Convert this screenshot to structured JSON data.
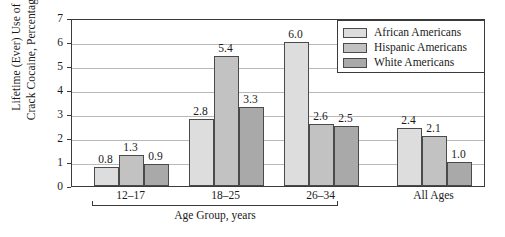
{
  "chart_data": {
    "type": "bar",
    "title": "",
    "xlabel": "Age Group, years",
    "ylabel": "Lifetime (Ever) Use of Crack Cocaine, Percentage",
    "ylabel_line1": "Lifetime (Ever) Use of",
    "ylabel_line2": "Crack Cocaine, Percentage",
    "categories": [
      "12–17",
      "18–25",
      "26–34",
      "All Ages"
    ],
    "bracket_categories": [
      "12–17",
      "18–25",
      "26–34"
    ],
    "series": [
      {
        "name": "African Americans",
        "color": "#dddddd",
        "values": [
          0.8,
          2.8,
          6.0,
          2.4
        ]
      },
      {
        "name": "Hispanic Americans",
        "color": "#c2c2c2",
        "values": [
          1.3,
          5.4,
          2.6,
          2.1
        ]
      },
      {
        "name": "White Americans",
        "color": "#a9a9a9",
        "values": [
          0.9,
          3.3,
          2.5,
          1.0
        ]
      }
    ],
    "value_labels": [
      [
        "0.8",
        "1.3",
        "0.9"
      ],
      [
        "2.8",
        "5.4",
        "3.3"
      ],
      [
        "6.0",
        "2.6",
        "2.5"
      ],
      [
        "2.4",
        "2.1",
        "1.0"
      ]
    ],
    "ylim": [
      0,
      7
    ],
    "yticks": [
      0,
      1,
      2,
      3,
      4,
      5,
      6,
      7
    ],
    "ytick_labels": [
      "0",
      "1",
      "2",
      "3",
      "4",
      "5",
      "6",
      "7"
    ],
    "grid": true,
    "grid_axis": "y",
    "legend_position": "upper right",
    "legend": {
      "entries": [
        {
          "label": "African Americans",
          "color": "#dddddd"
        },
        {
          "label": "Hispanic Americans",
          "color": "#c2c2c2"
        },
        {
          "label": "White Americans",
          "color": "#a9a9a9"
        }
      ]
    },
    "axis_color": "#3a3a3a",
    "gridline_color": "#b9b9b9",
    "background": "#ffffff"
  }
}
